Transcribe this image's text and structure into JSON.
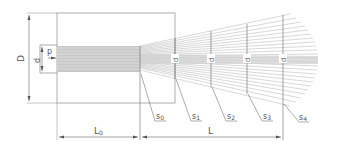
{
  "diagram": {
    "type": "technical-drawing",
    "line_color": "#7a7a7a",
    "fill_color": "#bdbdbd",
    "background": "#ffffff"
  },
  "labels": {
    "D": "D",
    "d": "d",
    "p": "p",
    "L0": "L",
    "L0_sub": "0",
    "L": "L",
    "sections": [
      {
        "name": "s",
        "sub": "0"
      },
      {
        "name": "s",
        "sub": "1"
      },
      {
        "name": "s",
        "sub": "2"
      },
      {
        "name": "s",
        "sub": "3"
      },
      {
        "name": "s",
        "sub": "4"
      }
    ],
    "diameters": [
      {
        "name": "d",
        "sub": "1"
      },
      {
        "name": "d",
        "sub": "2"
      },
      {
        "name": "d",
        "sub": "3"
      },
      {
        "name": "d",
        "sub": "4"
      }
    ]
  }
}
